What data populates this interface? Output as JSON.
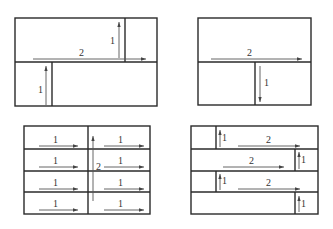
{
  "diagrams": [
    {
      "id": "top-left",
      "labels": {
        "long_arrow": "2",
        "upper_arrow": "1",
        "lower_arrow": "1"
      }
    },
    {
      "id": "top-right",
      "labels": {
        "long_arrow": "2",
        "down_arrow": "1"
      }
    },
    {
      "id": "bottom-left",
      "labels": {
        "left_rows": [
          "1",
          "1",
          "1",
          "1"
        ],
        "right_rows": [
          "1",
          "1",
          "1",
          "1"
        ],
        "center_arrow": "2"
      }
    },
    {
      "id": "bottom-right",
      "labels": {
        "row1_short": "1",
        "row1_long": "2",
        "row2_short": "1",
        "row2_long": "2",
        "row3_short": "1",
        "row3_long": "2",
        "row4_short": "1"
      }
    }
  ],
  "colors": {
    "line": "#2a2a2a",
    "arrow": "#555555",
    "background": "#ffffff"
  }
}
